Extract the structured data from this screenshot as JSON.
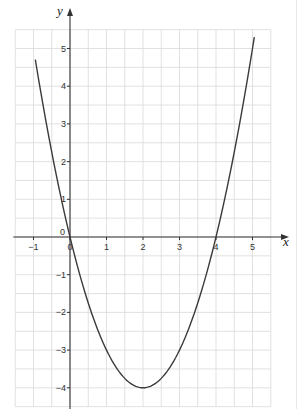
{
  "chart_data": {
    "type": "line",
    "title": "",
    "xlabel": "x",
    "ylabel": "y",
    "xlim": [
      -1.5,
      5.5
    ],
    "ylim": [
      -4.5,
      5.5
    ],
    "grid": true,
    "grid_step": 0.5,
    "x_ticks": [
      -1,
      0,
      1,
      2,
      3,
      4,
      5
    ],
    "y_ticks": [
      -4,
      -3,
      -2,
      -1,
      1,
      2,
      3,
      4,
      5
    ],
    "origin_label": "0",
    "series": [
      {
        "name": "y = x^2 - 4x",
        "equation": "y = x^2 - 4x",
        "x": [
          -0.9,
          -0.5,
          0,
          0.5,
          1,
          1.5,
          2,
          2.5,
          3,
          3.5,
          4,
          4.5,
          5,
          5.1
        ],
        "y": [
          4.41,
          2.25,
          0,
          -1.75,
          -3,
          -3.75,
          -4,
          -3.75,
          -3,
          -1.75,
          0,
          2.25,
          5,
          5.61
        ]
      }
    ],
    "key_points": {
      "roots": [
        [
          0,
          0
        ],
        [
          4,
          0
        ]
      ],
      "vertex": [
        2,
        -4
      ]
    },
    "colors": {
      "grid": "#d9d9d9",
      "axis": "#333333",
      "curve": "#3a3a3a"
    }
  }
}
